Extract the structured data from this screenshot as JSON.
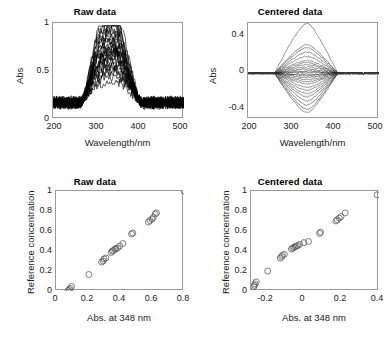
{
  "figure": {
    "width": 390,
    "height": 344,
    "background": "#ffffff",
    "axis_color": "#9a9a9a",
    "data_color": "#000000",
    "marker_color": "#555555"
  },
  "panels": {
    "raw_spectra": {
      "title": "Raw data",
      "xlabel": "Wavelength/nm",
      "ylabel": "Abs",
      "xticks": [
        "200",
        "300",
        "400",
        "500"
      ],
      "yticks": [
        "0",
        "0.5",
        "1"
      ]
    },
    "centered_spectra": {
      "title": "Centered data",
      "xlabel": "Wavelength/nm",
      "ylabel": "Abs",
      "xticks": [
        "200",
        "300",
        "400",
        "500"
      ],
      "yticks": [
        "-0.4",
        "0",
        "0.4"
      ]
    },
    "raw_scatter": {
      "title": "Raw data",
      "xlabel": "Abs. at 348 nm",
      "ylabel": "Reference concentration",
      "xticks": [
        "0",
        "0.2",
        "0.4",
        "0.6",
        "0.8"
      ],
      "yticks": [
        "0",
        "0.2",
        "0.4",
        "0.6",
        "0.8",
        "1"
      ]
    },
    "centered_scatter": {
      "title": "Centered data",
      "xlabel": "Abs. at 348 nm",
      "ylabel": "Reference concentration",
      "xticks": [
        "-0.2",
        "0",
        "0.2",
        "0.4"
      ],
      "yticks": [
        "0",
        "0.2",
        "0.4",
        "0.6",
        "0.8",
        "1"
      ]
    }
  },
  "chart_data": [
    {
      "id": "raw_spectra",
      "type": "line",
      "title": "Raw data",
      "xlabel": "Wavelength/nm",
      "ylabel": "Abs",
      "xlim": [
        195,
        510
      ],
      "ylim": [
        -0.02,
        1.05
      ],
      "xticks": [
        200,
        300,
        400,
        500
      ],
      "yticks": [
        0,
        0.5,
        1
      ],
      "grid": false,
      "legend": "none",
      "n_series": 26,
      "description": "26 noisy UV absorbance spectra; flat noisy baseline near 0.05-0.25 outside 270-400 nm, broad absorption band peaking near 300-360 nm with maxima ranging from about 0.2 up to 1.0",
      "series_peak_heights": [
        1.0,
        0.93,
        0.88,
        0.84,
        0.8,
        0.77,
        0.74,
        0.71,
        0.68,
        0.65,
        0.62,
        0.6,
        0.58,
        0.56,
        0.54,
        0.52,
        0.5,
        0.48,
        0.45,
        0.42,
        0.39,
        0.36,
        0.33,
        0.3,
        0.26,
        0.21
      ],
      "band_range_nm": [
        270,
        400
      ],
      "baseline_noise_range": [
        0.03,
        0.26
      ]
    },
    {
      "id": "centered_spectra",
      "type": "line",
      "title": "Centered data",
      "xlabel": "Wavelength/nm",
      "ylabel": "Abs",
      "xlim": [
        195,
        510
      ],
      "ylim": [
        -0.5,
        0.55
      ],
      "xticks": [
        200,
        300,
        400,
        500
      ],
      "yticks": [
        -0.4,
        0,
        0.4
      ],
      "grid": false,
      "legend": "none",
      "n_series": 26,
      "description": "Mean-centered spectra; nearly zero outside 265-410 nm, fanning out symmetrically about zero between 270 and 400 nm with extremes near +0.47 and -0.37 around 330-350 nm",
      "series_peak_heights": [
        0.47,
        0.27,
        0.24,
        0.2,
        0.16,
        0.12,
        0.1,
        0.08,
        0.06,
        0.04,
        0.02,
        0.01,
        -0.01,
        -0.02,
        -0.04,
        -0.06,
        -0.08,
        -0.1,
        -0.13,
        -0.16,
        -0.19,
        -0.22,
        -0.26,
        -0.3,
        -0.34,
        -0.37
      ],
      "band_range_nm": [
        265,
        410
      ]
    },
    {
      "id": "raw_scatter",
      "type": "scatter",
      "title": "Raw data",
      "xlabel": "Abs. at 348 nm",
      "ylabel": "Reference concentration",
      "xlim": [
        0,
        0.8
      ],
      "ylim": [
        0,
        1.0
      ],
      "xticks": [
        0,
        0.2,
        0.4,
        0.6,
        0.8
      ],
      "yticks": [
        0,
        0.2,
        0.4,
        0.6,
        0.8,
        1
      ],
      "grid": false,
      "legend": "none",
      "marker": "o",
      "points": [
        [
          0.075,
          0.005
        ],
        [
          0.083,
          0.015
        ],
        [
          0.09,
          0.025
        ],
        [
          0.097,
          0.045
        ],
        [
          0.205,
          0.165
        ],
        [
          0.285,
          0.29
        ],
        [
          0.295,
          0.3
        ],
        [
          0.3,
          0.32
        ],
        [
          0.312,
          0.33
        ],
        [
          0.345,
          0.385
        ],
        [
          0.352,
          0.4
        ],
        [
          0.36,
          0.405
        ],
        [
          0.368,
          0.418
        ],
        [
          0.375,
          0.425
        ],
        [
          0.385,
          0.43
        ],
        [
          0.398,
          0.45
        ],
        [
          0.418,
          0.475
        ],
        [
          0.472,
          0.57
        ],
        [
          0.48,
          0.58
        ],
        [
          0.578,
          0.69
        ],
        [
          0.588,
          0.705
        ],
        [
          0.6,
          0.72
        ],
        [
          0.608,
          0.735
        ],
        [
          0.62,
          0.77
        ],
        [
          0.628,
          0.782
        ],
        [
          0.8,
          1.0
        ]
      ]
    },
    {
      "id": "centered_scatter",
      "type": "scatter",
      "title": "Centered data",
      "xlabel": "Abs. at 348 nm",
      "ylabel": "Reference concentration",
      "xlim": [
        -0.28,
        0.41
      ],
      "ylim": [
        0,
        1.05
      ],
      "xticks": [
        -0.2,
        0,
        0.2,
        0.4
      ],
      "yticks": [
        0,
        0.2,
        0.4,
        0.6,
        0.8,
        1
      ],
      "grid": false,
      "legend": "none",
      "marker": "o",
      "points": [
        [
          -0.265,
          0.045
        ],
        [
          -0.262,
          0.06
        ],
        [
          -0.258,
          0.075
        ],
        [
          -0.252,
          0.095
        ],
        [
          -0.19,
          0.21
        ],
        [
          -0.122,
          0.345
        ],
        [
          -0.115,
          0.36
        ],
        [
          -0.11,
          0.375
        ],
        [
          -0.1,
          0.385
        ],
        [
          -0.062,
          0.44
        ],
        [
          -0.055,
          0.45
        ],
        [
          -0.048,
          0.458
        ],
        [
          -0.042,
          0.465
        ],
        [
          -0.035,
          0.47
        ],
        [
          -0.028,
          0.478
        ],
        [
          -0.018,
          0.49
        ],
        [
          0.005,
          0.508
        ],
        [
          0.03,
          0.52
        ],
        [
          0.09,
          0.605
        ],
        [
          0.095,
          0.618
        ],
        [
          0.178,
          0.735
        ],
        [
          0.185,
          0.748
        ],
        [
          0.196,
          0.765
        ],
        [
          0.205,
          0.782
        ],
        [
          0.228,
          0.82
        ],
        [
          0.4,
          1.01
        ]
      ]
    }
  ]
}
